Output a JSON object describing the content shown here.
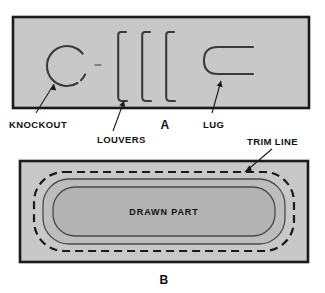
{
  "figure": {
    "background_color": "#ffffff",
    "panel_fill": "#c8c8c8",
    "panel_border_color": "#1a1a1a",
    "feature_line_color": "#3a3a3a",
    "drawn_part_fill": "#b3b3b3",
    "blank_fill": "#bdbdbd",
    "text_color": "#111111",
    "panels": [
      {
        "id": "A",
        "label": "A",
        "caption_label": "A",
        "features": [
          {
            "name": "knockout",
            "label": "KNOCKOUT",
            "shape": "circle-with-tab"
          },
          {
            "name": "louvers",
            "label": "LOUVERS",
            "shape": "three-vertical-slits",
            "count": 3
          },
          {
            "name": "lug",
            "label": "LUG",
            "shape": "u-slit-open-right"
          }
        ]
      },
      {
        "id": "B",
        "label": "B",
        "caption_label": "B",
        "features": [
          {
            "name": "trim-line",
            "label": "TRIM LINE",
            "shape": "dashed-rounded-outline"
          },
          {
            "name": "drawn-part",
            "label": "DRAWN PART",
            "shape": "stadium-rounded-rect"
          }
        ]
      }
    ],
    "callouts": [
      {
        "name": "knockout",
        "label": "KNOCKOUT"
      },
      {
        "name": "louvers",
        "label": "LOUVERS"
      },
      {
        "name": "lug",
        "label": "LUG"
      },
      {
        "name": "trim-line",
        "label": "TRIM LINE"
      }
    ],
    "inner_labels": [
      {
        "name": "drawn-part",
        "label": "DRAWN PART"
      }
    ]
  }
}
